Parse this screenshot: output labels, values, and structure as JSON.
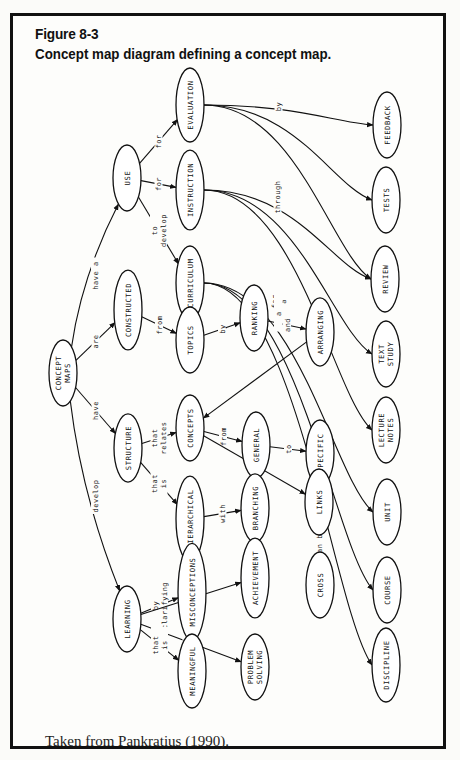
{
  "figure": {
    "number": "Figure 8-3",
    "title": "Concept map diagram defining a concept map.",
    "source": "Taken from Pankratius (1990)."
  },
  "diagram": {
    "orientation": "rotated 90° clockwise (text reads bottom-to-top)",
    "nodes": [
      {
        "id": "concept_maps",
        "label": [
          "CONCEPT",
          "MAPS"
        ],
        "x": 63,
        "y": 373
      },
      {
        "id": "use",
        "label": [
          "USE"
        ],
        "x": 127,
        "y": 178
      },
      {
        "id": "evaluation",
        "label": [
          "EVALUATION"
        ],
        "x": 190,
        "y": 105
      },
      {
        "id": "instruction",
        "label": [
          "INSTRUCTION"
        ],
        "x": 190,
        "y": 190
      },
      {
        "id": "curriculum",
        "label": [
          "CURRICULUM"
        ],
        "x": 190,
        "y": 283
      },
      {
        "id": "constructed",
        "label": [
          "CONSTRUCTED"
        ],
        "x": 128,
        "y": 310
      },
      {
        "id": "topics",
        "label": [
          "TOPICS"
        ],
        "x": 190,
        "y": 340
      },
      {
        "id": "ranking",
        "label": [
          "RANKING"
        ],
        "x": 254,
        "y": 318
      },
      {
        "id": "arranging",
        "label": [
          "ARRANGING"
        ],
        "x": 320,
        "y": 332
      },
      {
        "id": "structure",
        "label": [
          "STRUCTURE"
        ],
        "x": 128,
        "y": 448
      },
      {
        "id": "concepts",
        "label": [
          "CONCEPTS"
        ],
        "x": 190,
        "y": 428
      },
      {
        "id": "general",
        "label": [
          "GENERAL"
        ],
        "x": 256,
        "y": 445
      },
      {
        "id": "specific",
        "label": [
          "SPECIFIC"
        ],
        "x": 320,
        "y": 453
      },
      {
        "id": "hierarchical",
        "label": [
          "HIERARCHICAL"
        ],
        "x": 190,
        "y": 519
      },
      {
        "id": "branching",
        "label": [
          "BRANCHING"
        ],
        "x": 255,
        "y": 508
      },
      {
        "id": "links",
        "label": [
          "LINKS"
        ],
        "x": 319,
        "y": 502
      },
      {
        "id": "cross",
        "label": [
          "CROSS"
        ],
        "x": 320,
        "y": 585
      },
      {
        "id": "learning",
        "label": [
          "LEARNING"
        ],
        "x": 127,
        "y": 619
      },
      {
        "id": "misconceptions",
        "label": [
          "MISCONCEPTIONS"
        ],
        "x": 192,
        "y": 592
      },
      {
        "id": "achievement",
        "label": [
          "ACHIEVEMENT"
        ],
        "x": 255,
        "y": 578
      },
      {
        "id": "meaningful",
        "label": [
          "MEANINGFUL"
        ],
        "x": 192,
        "y": 671
      },
      {
        "id": "problem_solving",
        "label": [
          "PROBLEM",
          "SOLVING"
        ],
        "x": 255,
        "y": 667
      },
      {
        "id": "feedback",
        "label": [
          "FEEDBACK"
        ],
        "x": 387,
        "y": 125
      },
      {
        "id": "tests",
        "label": [
          "TESTS"
        ],
        "x": 386,
        "y": 200
      },
      {
        "id": "review",
        "label": [
          "REVIEW"
        ],
        "x": 385,
        "y": 279
      },
      {
        "id": "text_study",
        "label": [
          "TEXT",
          "STUDY"
        ],
        "x": 386,
        "y": 354
      },
      {
        "id": "lecture_notes",
        "label": [
          "LECTURE",
          "NOTES"
        ],
        "x": 386,
        "y": 430
      },
      {
        "id": "unit",
        "label": [
          "UNIT"
        ],
        "x": 387,
        "y": 512
      },
      {
        "id": "course",
        "label": [
          "COURSE"
        ],
        "x": 387,
        "y": 590
      },
      {
        "id": "discipline",
        "label": [
          "DISCIPLINE"
        ],
        "x": 386,
        "y": 665
      }
    ],
    "edges": [
      {
        "from": "concept_maps",
        "to": "use",
        "label": [
          "have a"
        ]
      },
      {
        "from": "concept_maps",
        "to": "constructed",
        "label": [
          "are"
        ]
      },
      {
        "from": "concept_maps",
        "to": "structure",
        "label": [
          "have"
        ]
      },
      {
        "from": "concept_maps",
        "to": "learning",
        "label": [
          "develop"
        ]
      },
      {
        "from": "use",
        "to": "evaluation",
        "label": [
          "for"
        ]
      },
      {
        "from": "use",
        "to": "instruction",
        "label": [
          "for"
        ]
      },
      {
        "from": "use",
        "to": "curriculum",
        "label": [
          "to",
          "develop"
        ]
      },
      {
        "from": "constructed",
        "to": "topics",
        "label": [
          "from"
        ]
      },
      {
        "from": "topics",
        "to": "ranking",
        "label": [
          "by"
        ]
      },
      {
        "from": "ranking",
        "to": "arranging",
        "label": [
          "and"
        ]
      },
      {
        "from": "arranging",
        "to": "concepts",
        "label": []
      },
      {
        "from": "structure",
        "to": "concepts",
        "label": [
          "that",
          "relates"
        ]
      },
      {
        "from": "concepts",
        "to": "general",
        "label": [
          "from"
        ]
      },
      {
        "from": "general",
        "to": "specific",
        "label": [
          "to"
        ]
      },
      {
        "from": "concepts",
        "to": "links",
        "label": [
          "with"
        ]
      },
      {
        "from": "structure",
        "to": "hierarchical",
        "label": [
          "that",
          "is"
        ]
      },
      {
        "from": "hierarchical",
        "to": "branching",
        "label": [
          "with"
        ]
      },
      {
        "from": "links",
        "to": "cross",
        "label": [
          "can be"
        ]
      },
      {
        "from": "learning",
        "to": "misconceptions",
        "label": [
          "by",
          "clarifying"
        ]
      },
      {
        "from": "learning",
        "to": "achievement",
        "label": [
          "by",
          "increasing"
        ]
      },
      {
        "from": "learning",
        "to": "problem_solving",
        "label": [
          "by",
          "improving"
        ]
      },
      {
        "from": "learning",
        "to": "meaningful",
        "label": [
          "that",
          "is"
        ]
      },
      {
        "from": "evaluation",
        "to": "feedback",
        "label": [
          "by"
        ]
      },
      {
        "from": "evaluation",
        "to": "tests",
        "label": []
      },
      {
        "from": "evaluation",
        "to": "review",
        "label": []
      },
      {
        "from": "instruction",
        "to": "review",
        "label": [
          "through"
        ]
      },
      {
        "from": "instruction",
        "to": "text_study",
        "label": []
      },
      {
        "from": "instruction",
        "to": "lecture_notes",
        "label": []
      },
      {
        "from": "curriculum",
        "to": "unit",
        "label": [
          "for",
          "a"
        ]
      },
      {
        "from": "curriculum",
        "to": "course",
        "label": [
          "a"
        ]
      },
      {
        "from": "curriculum",
        "to": "discipline",
        "label": [
          "a"
        ]
      }
    ]
  }
}
